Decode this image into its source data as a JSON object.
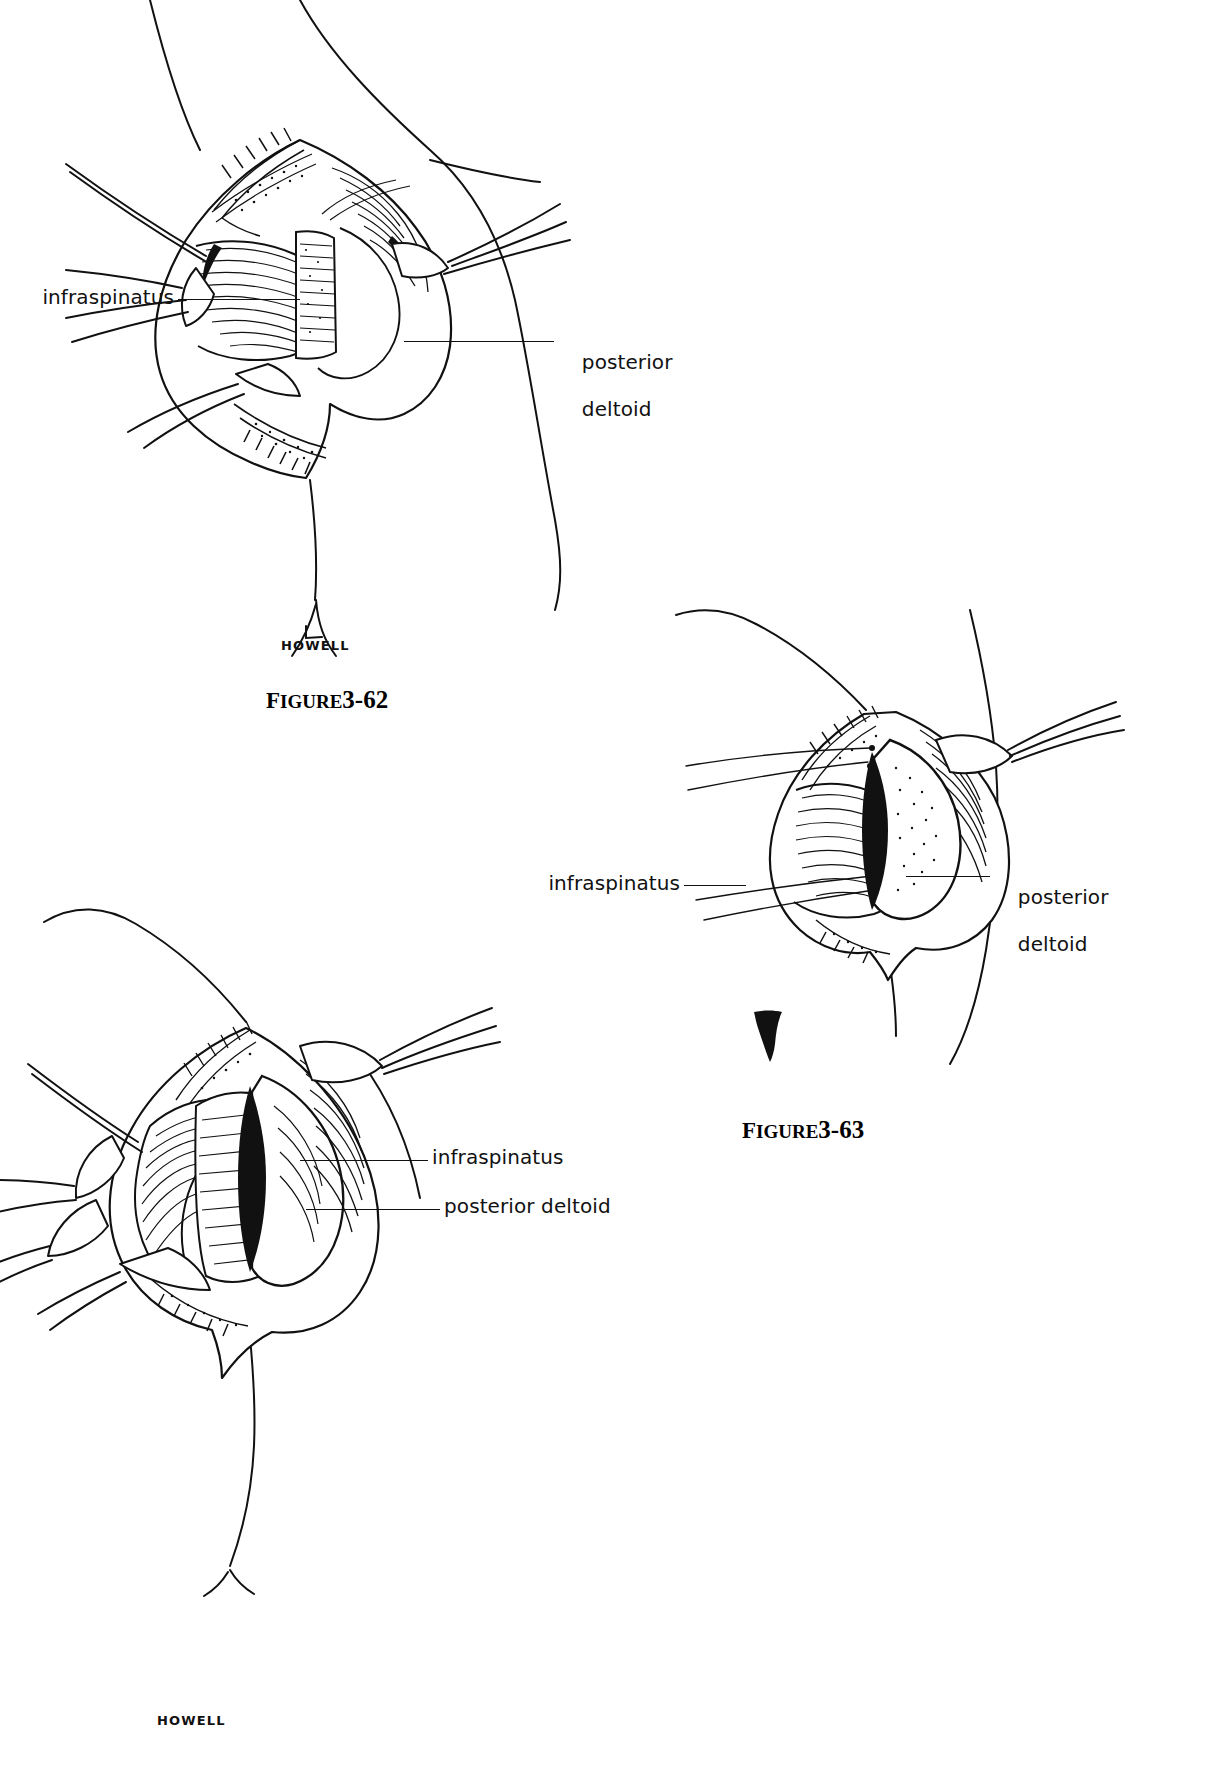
{
  "page": {
    "kind": "surgical-atlas-plate",
    "background_color": "#ffffff",
    "ink_color": "#111111"
  },
  "figures": [
    {
      "id": "figure-3-62",
      "caption_prefix": "F",
      "caption_word": "IGURE",
      "caption_number": "3-62",
      "caption_full": "FIGURE 3-62",
      "signature": "HOWELL",
      "subject": "posterior shoulder approach, infraspinatus split with retractors",
      "labels": [
        {
          "name": "infraspinatus",
          "text": "infraspinatus",
          "side": "left",
          "lines": [
            "infraspinatus"
          ]
        },
        {
          "name": "posterior-deltoid",
          "text": "posterior deltoid",
          "side": "right",
          "lines": [
            "posterior",
            "deltoid"
          ]
        }
      ]
    },
    {
      "id": "figure-3-63",
      "caption_prefix": "F",
      "caption_word": "IGURE",
      "caption_number": "3-63",
      "caption_full": "FIGURE 3-63",
      "signature": "",
      "subject": "posterior shoulder approach, deeper exposure of capsule",
      "labels": [
        {
          "name": "infraspinatus",
          "text": "infraspinatus",
          "side": "left",
          "lines": [
            "infraspinatus"
          ]
        },
        {
          "name": "posterior-deltoid",
          "text": "posterior deltoid",
          "side": "right",
          "lines": [
            "posterior",
            "deltoid"
          ]
        }
      ]
    },
    {
      "id": "figure-lower-left",
      "caption_prefix": "",
      "caption_word": "",
      "caption_number": "",
      "caption_full": "",
      "signature": "HOWELL",
      "subject": "posterior shoulder approach, interval retracted with humeral head exposed",
      "labels": [
        {
          "name": "infraspinatus",
          "text": "infraspinatus",
          "side": "right",
          "lines": [
            "infraspinatus"
          ]
        },
        {
          "name": "posterior-deltoid",
          "text": "posterior deltoid",
          "side": "right",
          "lines": [
            "posterior deltoid"
          ]
        }
      ]
    }
  ]
}
